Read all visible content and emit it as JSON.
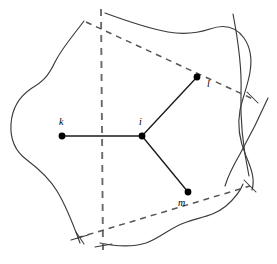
{
  "figure": {
    "title": "",
    "colors": {
      "background": "#ffffff",
      "outline": "#3a3a3a",
      "dashed": "#565656",
      "dashed_vertical": "#6a6a6a",
      "edge": "#1a1a1a",
      "node": "#000000"
    }
  },
  "nodes": [
    {
      "id": "k",
      "label": "k",
      "x": 62,
      "y": 136,
      "r": 3.4,
      "label_x": 59,
      "label_y": 125
    },
    {
      "id": "i",
      "label": "i",
      "x": 142,
      "y": 136,
      "r": 3.4,
      "label_x": 139,
      "label_y": 125
    },
    {
      "id": "l",
      "label": "l",
      "x": 197,
      "y": 77,
      "r": 3.4,
      "label_x": 207,
      "label_y": 87
    },
    {
      "id": "m",
      "label": "m",
      "x": 188,
      "y": 192,
      "r": 3.4,
      "label_x": 178,
      "label_y": 206
    }
  ],
  "edges": [
    {
      "from": "k",
      "to": "i",
      "d": "M 62 136 L 142 136"
    },
    {
      "from": "i",
      "to": "l",
      "d": "M 142 136 L 197 77"
    },
    {
      "from": "i",
      "to": "m",
      "d": "M 142 136 L 188 192"
    }
  ],
  "region_outline": {
    "name": "irregular-region",
    "segments": [
      "M 84 21 C 72 37, 62 48, 55 62 C 48 77, 42 82, 32 88 C 20 96, 12 108, 11 124 C 10 140, 16 152, 27 160 C 39 169, 49 178, 57 191 C 65 204, 72 221, 80 243",
      "M 105 13 C 124 20, 146 28, 168 32 C 186 35, 198 33, 210 29 C 224 24, 236 27, 244 38 C 251 48, 252 60, 250 72 C 248 85, 243 96, 240 110 C 237 126, 240 142, 246 156 C 252 170, 255 180, 252 190",
      "M 100 243 C 114 246, 130 248, 146 243 C 160 238, 170 228, 184 223 C 200 217, 214 216, 226 206 C 234 199, 240 192, 243 184"
    ]
  },
  "extra_curves": [
    {
      "name": "right-boundary-curve-upper",
      "d": "M 233 14 C 238 40, 242 66, 241 92 C 240 120, 243 148, 249 176"
    },
    {
      "name": "right-boundary-curve-lower",
      "d": "M 268 98 C 260 116, 250 136, 240 154 C 233 166, 228 176, 225 186"
    }
  ],
  "dashed_lines": [
    {
      "name": "bisector-vertical",
      "d": "M 101 9 L 103 250",
      "style": "vertical"
    },
    {
      "name": "bisector-i-l",
      "d": "M 86 22 L 253 99",
      "style": "diagonal"
    },
    {
      "name": "bisector-i-m",
      "d": "M 77 238 L 250 186",
      "style": "diagonal"
    }
  ],
  "tick_marks": [
    {
      "name": "tick-lower-left",
      "d": "M 76 232 L 84 244"
    },
    {
      "name": "tick-lower-left-cross",
      "d": "M 71 240 L 88 235"
    },
    {
      "name": "tick-right-upper",
      "d": "M 247 92 L 258 103"
    },
    {
      "name": "tick-right-lower",
      "d": "M 244 180 L 256 192"
    },
    {
      "name": "tick-vertical-bottom",
      "d": "M 95 247 L 112 244"
    }
  ]
}
